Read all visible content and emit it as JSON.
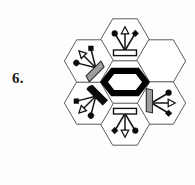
{
  "item": {
    "number_label": "6.",
    "kind": "nonverbal-reasoning-hexagon-matrix"
  },
  "colors": {
    "page_background": "#fdfdfd",
    "hex_stroke": "#4a4a4a",
    "hex_fill": "#ffffff",
    "ink": "#141414",
    "emblem_black": "#000000",
    "base_gray": "#9e9e9e",
    "base_black": "#0b0b0b",
    "base_white": "#ffffff"
  },
  "grid": {
    "name": "hexagon-cluster",
    "cell_count": 7,
    "arrangement": "one center cell surrounded by six ring cells",
    "cells": [
      {
        "id": "center",
        "position_label": "center",
        "cx": 125,
        "cy": 82,
        "content": "thick-black-hexagon-outline",
        "content_kind": "emblem",
        "empty": false
      },
      {
        "id": "top",
        "position_label": "top",
        "cx": 125,
        "cy": 40,
        "content": "trident-symbol",
        "content_kind": "symbol",
        "rotation_deg": 0,
        "base_style": "white",
        "arrow_direction": "up",
        "empty": false
      },
      {
        "id": "top-right",
        "position_label": "top-right",
        "cx": 161,
        "cy": 61,
        "content": "",
        "content_kind": "blank",
        "empty": true,
        "role": "answer-slot"
      },
      {
        "id": "right",
        "position_label": "bottom-right",
        "cx": 161,
        "cy": 103,
        "content": "trident-symbol",
        "content_kind": "symbol",
        "rotation_deg": 90,
        "base_style": "gray",
        "arrow_direction": "right",
        "empty": false
      },
      {
        "id": "bottom",
        "position_label": "bottom",
        "cx": 125,
        "cy": 124,
        "content": "trident-symbol",
        "content_kind": "symbol",
        "rotation_deg": 180,
        "base_style": "white",
        "arrow_direction": "down",
        "empty": false
      },
      {
        "id": "bottom-left",
        "position_label": "bottom-left",
        "cx": 89,
        "cy": 103,
        "content": "trident-symbol",
        "content_kind": "symbol",
        "rotation_deg": 225,
        "base_style": "black",
        "arrow_direction": "down-left",
        "empty": false
      },
      {
        "id": "top-left",
        "position_label": "top-left",
        "cx": 89,
        "cy": 61,
        "content": "trident-symbol",
        "content_kind": "symbol",
        "rotation_deg": 315,
        "base_style": "gray",
        "arrow_direction": "up-left",
        "empty": false
      }
    ]
  },
  "symbol_legend": {
    "name": "trident-symbol",
    "parts": [
      {
        "part": "base-bar",
        "shape": "rectangle"
      },
      {
        "part": "center-prong",
        "shape": "hollow-triangle-arrowhead"
      },
      {
        "part": "left-prong",
        "shape": "filled-circle"
      },
      {
        "part": "right-prong",
        "shape": "filled-diamond"
      }
    ]
  }
}
